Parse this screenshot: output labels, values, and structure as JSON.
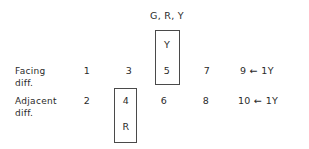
{
  "header": {
    "colors_label": "G, R, Y"
  },
  "boxes": {
    "facing_box": {
      "top": "Y",
      "bottom": "5"
    },
    "adjacent_box": {
      "top": "4",
      "bottom": "R"
    }
  },
  "rows": {
    "facing": {
      "label_line1": "Facing",
      "label_line2": "diff.",
      "values": [
        "1",
        "3",
        "5",
        "7",
        "9"
      ],
      "arrow": "←",
      "note": "1Y"
    },
    "adjacent": {
      "label_line1": "Adjacent",
      "label_line2": "diff.",
      "values": [
        "2",
        "4",
        "6",
        "8",
        "10"
      ],
      "arrow": "←",
      "note": "1Y"
    }
  }
}
